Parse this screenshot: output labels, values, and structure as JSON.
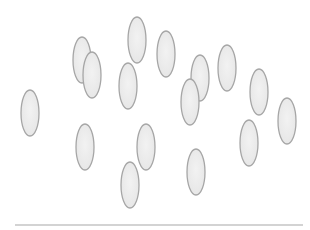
{
  "scene": {
    "width": 310,
    "height": 230,
    "background": "#ffffff",
    "shape": "oval",
    "shape_count": 16,
    "oval_fill": "#e6e6e6",
    "oval_fill_highlight": "#f2f2f2",
    "oval_stroke": "#a6a6a6",
    "oval_rx": 9,
    "oval_ry": 23,
    "ovals": [
      {
        "cx": 30,
        "cy": 113
      },
      {
        "cx": 82,
        "cy": 60
      },
      {
        "cx": 92,
        "cy": 75
      },
      {
        "cx": 137,
        "cy": 40
      },
      {
        "cx": 128,
        "cy": 86
      },
      {
        "cx": 166,
        "cy": 54
      },
      {
        "cx": 200,
        "cy": 78
      },
      {
        "cx": 190,
        "cy": 102
      },
      {
        "cx": 227,
        "cy": 68
      },
      {
        "cx": 259,
        "cy": 92
      },
      {
        "cx": 287,
        "cy": 121
      },
      {
        "cx": 85,
        "cy": 147
      },
      {
        "cx": 146,
        "cy": 147
      },
      {
        "cx": 130,
        "cy": 185
      },
      {
        "cx": 196,
        "cy": 172
      },
      {
        "cx": 249,
        "cy": 143
      }
    ],
    "baseline": {
      "x1": 15,
      "x2": 303,
      "y": 225,
      "color": "#c4c4c4",
      "width": 1.5
    }
  }
}
